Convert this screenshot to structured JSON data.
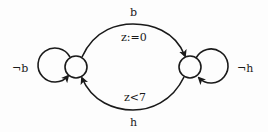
{
  "diagram": {
    "type": "timed-automaton",
    "states": [
      {
        "id": "s0",
        "name": "left-state"
      },
      {
        "id": "s1",
        "name": "right-state"
      }
    ],
    "transitions": [
      {
        "from": "s0",
        "to": "s0",
        "label": "¬b"
      },
      {
        "from": "s0",
        "to": "s1",
        "event": "b",
        "update": "z:=0"
      },
      {
        "from": "s1",
        "to": "s0",
        "event": "h",
        "guard": "z<7"
      },
      {
        "from": "s1",
        "to": "s1",
        "label": "¬h"
      }
    ],
    "labels": {
      "loop_left": "¬b",
      "top_event": "b",
      "top_update": "z:=0",
      "bottom_guard": "z<7",
      "bottom_event": "h",
      "loop_right": "¬h"
    },
    "colors": {
      "stroke": "#1a1a1a",
      "background": "#fdfdfd"
    }
  }
}
